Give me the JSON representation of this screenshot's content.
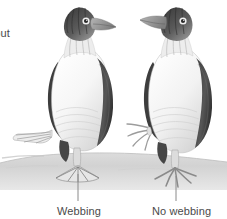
{
  "figure": {
    "background_color": "#ffffff",
    "width": 227,
    "height": 219
  },
  "labels": {
    "left_cropped": "hout",
    "webbing": "Webbing",
    "no_webbing": "No webbing"
  },
  "colors": {
    "text": "#4a4a4a",
    "ground": "#d9d9d9",
    "ground_shadow": "#c4c4c4",
    "plumage_dark": "#4e4e4e",
    "plumage_mid": "#8f8f8f",
    "plumage_light": "#f2f2f2",
    "beak": "#9a9a9a",
    "foot": "#e2e2e2",
    "leader_line": "#8a8a8a"
  },
  "subjects": [
    {
      "name": "left-bird",
      "facing": "left",
      "foot_type": "webbed",
      "callout": "Webbing"
    },
    {
      "name": "right-bird",
      "facing": "left",
      "foot_type": "unwebbed",
      "callout": "No webbing"
    }
  ]
}
